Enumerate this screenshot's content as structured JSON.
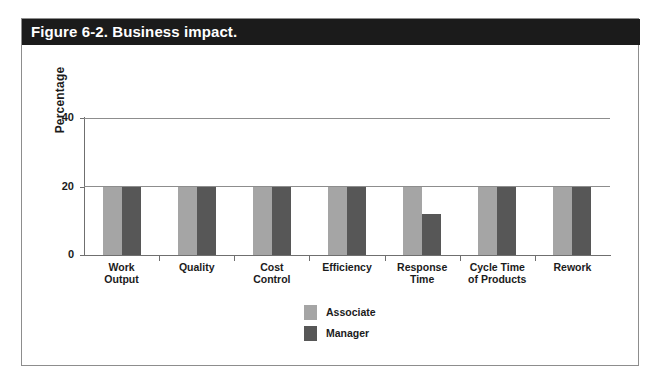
{
  "figure": {
    "caption": "Figure 6-2. Business impact."
  },
  "chart_data": {
    "type": "bar",
    "title": "Figure 6-2. Business impact.",
    "xlabel": "",
    "ylabel": "Percentage",
    "ylim": [
      0,
      40
    ],
    "yticks": [
      "0",
      "20",
      "40"
    ],
    "ytick_values": [
      0,
      20,
      40
    ],
    "grid": true,
    "legend_position": "bottom-center",
    "categories": [
      "Work Output",
      "Quality",
      "Cost Control",
      "Efficiency",
      "Response Time",
      "Cycle Time of Products",
      "Rework"
    ],
    "category_lines": [
      [
        "Work",
        "Output"
      ],
      [
        "Quality",
        ""
      ],
      [
        "Cost",
        "Control"
      ],
      [
        "Efficiency",
        ""
      ],
      [
        "Response",
        "Time"
      ],
      [
        "Cycle Time",
        "of Products"
      ],
      [
        "Rework",
        ""
      ]
    ],
    "series": [
      {
        "name": "Associate",
        "color": "#a5a5a5",
        "values": [
          20,
          20,
          20,
          20,
          20,
          20,
          20
        ]
      },
      {
        "name": "Manager",
        "color": "#575757",
        "values": [
          20,
          20,
          20,
          20,
          12,
          20,
          20
        ]
      }
    ]
  },
  "colors": {
    "banner_background": "#1b1b1b",
    "banner_text": "#ffffff",
    "frame_border": "#8d8d8d",
    "axis": "#6f6f6f",
    "associate": "#a5a5a5",
    "manager": "#575757"
  }
}
